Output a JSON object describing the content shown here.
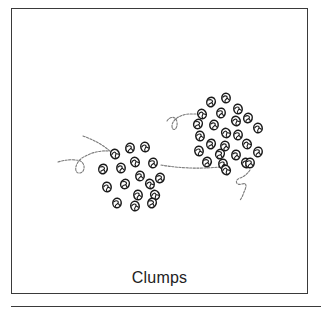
{
  "figure": {
    "caption": "Clumps",
    "colors": {
      "frame": "#3a3a3a",
      "bead_outline": "#1a1a1a",
      "thread": "#7a7a7a",
      "caption_text": "#222222",
      "background": "#ffffff"
    },
    "left_clump": {
      "bead_count": 17,
      "beads": [
        [
          115,
          154
        ],
        [
          130,
          148
        ],
        [
          145,
          147
        ],
        [
          103,
          169
        ],
        [
          121,
          168
        ],
        [
          135,
          162
        ],
        [
          153,
          163
        ],
        [
          107,
          187
        ],
        [
          125,
          184
        ],
        [
          140,
          176
        ],
        [
          150,
          184
        ],
        [
          160,
          178
        ],
        [
          138,
          195
        ],
        [
          155,
          195
        ],
        [
          117,
          203
        ],
        [
          135,
          206
        ],
        [
          152,
          203
        ]
      ]
    },
    "right_clump": {
      "bead_count": 25,
      "beads": [
        [
          211,
          102
        ],
        [
          226,
          98
        ],
        [
          202,
          114
        ],
        [
          221,
          113
        ],
        [
          238,
          109
        ],
        [
          198,
          124
        ],
        [
          214,
          125
        ],
        [
          236,
          121
        ],
        [
          248,
          118
        ],
        [
          200,
          136
        ],
        [
          226,
          133
        ],
        [
          238,
          135
        ],
        [
          258,
          128
        ],
        [
          211,
          144
        ],
        [
          225,
          146
        ],
        [
          247,
          144
        ],
        [
          258,
          152
        ],
        [
          199,
          151
        ],
        [
          220,
          154
        ],
        [
          236,
          155
        ],
        [
          246,
          163
        ],
        [
          207,
          162
        ],
        [
          223,
          164
        ],
        [
          226,
          170
        ],
        [
          250,
          163
        ]
      ]
    },
    "threads": [
      {
        "id": "left-upper-thread",
        "path": "M83,136 Q100,142 111,152"
      },
      {
        "id": "left-loop-thread",
        "path": "M58,162 Q68,159 76,160 C86,160 86,172 80,173 C74,174 74,164 82,158 Q95,150 109,151"
      },
      {
        "id": "connecting-thread",
        "path": "M161,165 Q190,170 220,167"
      },
      {
        "id": "right-upper-loop-thread",
        "path": "M167,121 C170,116 176,116 177,122 C178,130 172,132 172,126 C172,119 182,114 190,114 L199,114"
      },
      {
        "id": "right-lower-loop-thread",
        "path": "M250,170 Q246,176 240,178 C234,180 236,186 242,184 C248,182 246,188 244,192 Q242,198 240,200"
      }
    ]
  }
}
